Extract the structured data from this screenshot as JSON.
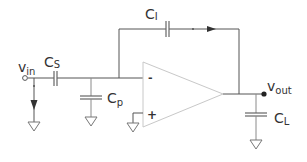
{
  "diagram": {
    "type": "circuit-schematic",
    "colors": {
      "wire": "#555555",
      "opamp_outline": "#c8c8c8",
      "text": "#333333"
    },
    "labels": {
      "vin": {
        "main": "v",
        "sub": "in"
      },
      "cs": {
        "main": "C",
        "sub": "S"
      },
      "cp": {
        "main": "C",
        "sub": "p"
      },
      "ci": {
        "main": "C",
        "sub": "I"
      },
      "vout": {
        "main": "v",
        "sub": "out"
      },
      "cl": {
        "main": "C",
        "sub": "L"
      }
    },
    "opamp": {
      "inverting_sign": "-",
      "noninverting_sign": "+"
    },
    "components": [
      {
        "id": "cs",
        "kind": "capacitor",
        "label": "CS",
        "between": [
          "vin",
          "inverting-input"
        ]
      },
      {
        "id": "cp",
        "kind": "capacitor",
        "label": "Cp",
        "between": [
          "inverting-input",
          "ground"
        ]
      },
      {
        "id": "ci",
        "kind": "capacitor",
        "label": "CI",
        "between": [
          "inverting-input",
          "output"
        ]
      },
      {
        "id": "cl",
        "kind": "capacitor",
        "label": "CL",
        "between": [
          "output",
          "ground"
        ]
      },
      {
        "id": "amp",
        "kind": "op-amp"
      }
    ]
  }
}
